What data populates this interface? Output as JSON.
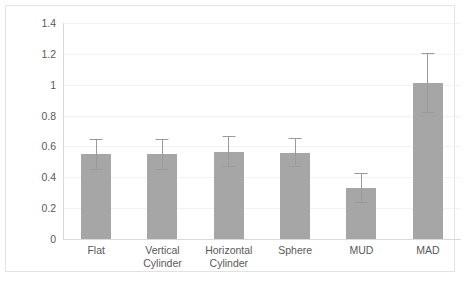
{
  "chart_data": {
    "type": "bar",
    "title": "",
    "xlabel": "",
    "ylabel": "",
    "ylim": [
      0,
      1.4
    ],
    "ytick_labels": [
      "0",
      "0.2",
      "0.4",
      "0.6",
      "0.8",
      "1",
      "1.2",
      "1.4"
    ],
    "ytick_values": [
      0,
      0.2,
      0.4,
      0.6,
      0.8,
      1,
      1.2,
      1.4
    ],
    "grid": true,
    "legend": "none",
    "bar_color": "#a6a6a6",
    "error_bar_color": "#9a9a9a",
    "categories": [
      "Flat",
      "Vertical Cylinder",
      "Horizontal Cylinder",
      "Sphere",
      "MUD",
      "MAD"
    ],
    "category_lines": [
      [
        "Flat"
      ],
      [
        "Vertical",
        "Cylinder"
      ],
      [
        "Horizontal",
        "Cylinder"
      ],
      [
        "Sphere"
      ],
      [
        "MUD"
      ],
      [
        "MAD"
      ]
    ],
    "values": [
      0.55,
      0.55,
      0.565,
      0.56,
      0.33,
      1.01
    ],
    "errors": [
      0.1,
      0.1,
      0.1,
      0.095,
      0.095,
      0.195
    ],
    "series": [
      {
        "name": "mean",
        "values": [
          0.55,
          0.55,
          0.565,
          0.56,
          0.33,
          1.01
        ],
        "errors": [
          0.1,
          0.1,
          0.1,
          0.095,
          0.095,
          0.195
        ]
      }
    ]
  }
}
